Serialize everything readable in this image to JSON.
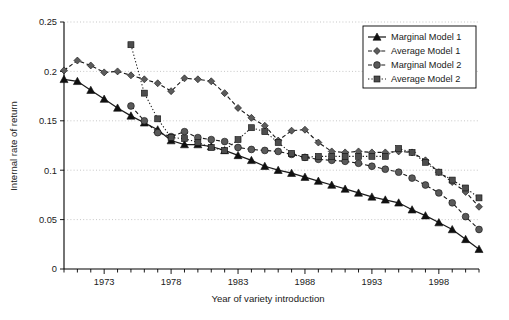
{
  "chart_data": {
    "type": "line",
    "title": "",
    "xlabel": "Year of variety introduction",
    "ylabel": "Internal rate of return",
    "xlim": [
      1970,
      2001
    ],
    "ylim": [
      0,
      0.25
    ],
    "xticks": [
      1973,
      1978,
      1983,
      1988,
      1993,
      1998
    ],
    "xtick_labels": [
      "1973",
      "1978",
      "1983",
      "1988",
      "1993",
      "1998"
    ],
    "yticks": [
      0,
      0.05,
      0.1,
      0.15,
      0.2,
      0.25
    ],
    "ytick_labels": [
      "0",
      "0.05",
      "0.1",
      "0.15",
      "0.2",
      "0.25"
    ],
    "grid": "horizontal-dotted",
    "legend_position": "top-right",
    "series": [
      {
        "name": "Marginal Model 1",
        "marker": "triangle",
        "linestyle": "solid",
        "x": [
          1970,
          1971,
          1972,
          1973,
          1974,
          1975,
          1976,
          1977,
          1978,
          1979,
          1980,
          1981,
          1982,
          1983,
          1984,
          1985,
          1986,
          1987,
          1988,
          1989,
          1990,
          1991,
          1992,
          1993,
          1994,
          1995,
          1996,
          1997,
          1998,
          1999,
          2000,
          2001
        ],
        "y": [
          0.192,
          0.19,
          0.181,
          0.172,
          0.163,
          0.155,
          0.148,
          0.141,
          0.13,
          0.126,
          0.126,
          0.124,
          0.12,
          0.115,
          0.11,
          0.104,
          0.1,
          0.097,
          0.093,
          0.089,
          0.085,
          0.081,
          0.077,
          0.073,
          0.07,
          0.067,
          0.06,
          0.054,
          0.047,
          0.04,
          0.03,
          0.02
        ]
      },
      {
        "name": "Average Model 1",
        "marker": "diamond",
        "linestyle": "dashed",
        "x": [
          1970,
          1971,
          1972,
          1973,
          1974,
          1975,
          1976,
          1977,
          1978,
          1979,
          1980,
          1981,
          1982,
          1983,
          1984,
          1985,
          1986,
          1987,
          1988,
          1989,
          1990,
          1991,
          1992,
          1993,
          1994,
          1995,
          1996,
          1997,
          1998,
          1999,
          2000,
          2001
        ],
        "y": [
          0.201,
          0.211,
          0.206,
          0.199,
          0.2,
          0.196,
          0.192,
          0.188,
          0.18,
          0.193,
          0.192,
          0.19,
          0.178,
          0.163,
          0.153,
          0.145,
          0.13,
          0.14,
          0.141,
          0.128,
          0.119,
          0.118,
          0.119,
          0.118,
          0.118,
          0.119,
          0.118,
          0.11,
          0.098,
          0.088,
          0.078,
          0.063
        ]
      },
      {
        "name": "Marginal Model 2",
        "marker": "circle",
        "linestyle": "dashed",
        "x": [
          1975,
          1976,
          1977,
          1978,
          1979,
          1980,
          1981,
          1982,
          1983,
          1984,
          1985,
          1986,
          1987,
          1988,
          1989,
          1990,
          1991,
          1992,
          1993,
          1994,
          1995,
          1996,
          1997,
          1998,
          1999,
          2000,
          2001
        ],
        "y": [
          0.165,
          0.15,
          0.138,
          0.134,
          0.139,
          0.133,
          0.131,
          0.129,
          0.123,
          0.121,
          0.12,
          0.119,
          0.116,
          0.113,
          0.111,
          0.11,
          0.109,
          0.107,
          0.104,
          0.101,
          0.098,
          0.092,
          0.085,
          0.077,
          0.067,
          0.053,
          0.04
        ]
      },
      {
        "name": "Average Model 2",
        "marker": "square",
        "linestyle": "dotted",
        "x": [
          1975,
          1976,
          1977,
          1978,
          1979,
          1980,
          1981,
          1982,
          1983,
          1984,
          1985,
          1986,
          1987,
          1988,
          1989,
          1990,
          1991,
          1992,
          1993,
          1994,
          1995,
          1996,
          1997,
          1998,
          1999,
          2000,
          2001
        ],
        "y": [
          0.227,
          0.178,
          0.152,
          0.133,
          0.132,
          0.128,
          0.123,
          0.12,
          0.131,
          0.143,
          0.139,
          0.128,
          0.117,
          0.113,
          0.114,
          0.114,
          0.114,
          0.114,
          0.114,
          0.114,
          0.122,
          0.118,
          0.108,
          0.098,
          0.09,
          0.082,
          0.072
        ]
      }
    ]
  },
  "legend": {
    "items": [
      {
        "label": "Marginal Model 1"
      },
      {
        "label": "Average Model 1"
      },
      {
        "label": "Marginal Model 2"
      },
      {
        "label": "Average Model 2"
      }
    ]
  },
  "caption": {
    "text": ""
  }
}
